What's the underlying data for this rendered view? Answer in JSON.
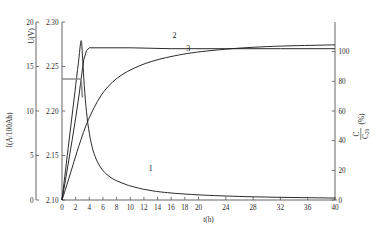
{
  "chart_data": {
    "type": "line",
    "title": "",
    "xlabel": "t(h)",
    "xlim": [
      0,
      40
    ],
    "x_ticks": [
      0,
      2,
      4,
      6,
      8,
      10,
      12,
      14,
      16,
      18,
      20,
      24,
      28,
      32,
      36,
      40
    ],
    "x_tick_labels": [
      "0",
      "2",
      "4",
      "6",
      "8",
      "10",
      "12",
      "14",
      "16",
      "18",
      "20",
      "24",
      "28",
      "32",
      "36",
      "40"
    ],
    "grid": false,
    "legend_position": "inline-curve-labels",
    "axes": [
      {
        "id": "axis-current",
        "position": "outer-left",
        "label": "I(A/100Ah)",
        "lim": [
          0,
          20
        ],
        "ticks": [
          0,
          5,
          10,
          15,
          20
        ],
        "tick_labels": [
          "0",
          "5",
          "10",
          "15",
          "20"
        ]
      },
      {
        "id": "axis-voltage",
        "position": "inner-left",
        "label": "U(V)",
        "lim": [
          2.1,
          2.3
        ],
        "ticks": [
          2.1,
          2.15,
          2.2,
          2.25,
          2.3
        ],
        "tick_labels": [
          "2.10",
          "2.15",
          "2.20",
          "2.25",
          "2.30"
        ]
      },
      {
        "id": "axis-capacity",
        "position": "right",
        "label_numerator": "C",
        "label_denominator": "C",
        "label_denominator_sub": "20",
        "label_units": "(%)",
        "label": "C/C20 (%)",
        "lim": [
          0,
          120
        ],
        "ticks": [
          0,
          20,
          40,
          60,
          80,
          100
        ],
        "tick_labels": [
          "0",
          "20",
          "40",
          "60",
          "80",
          "100"
        ]
      }
    ],
    "series": [
      {
        "name": "1",
        "curve_label": "1",
        "axis": "axis-current",
        "description": "charging current",
        "color": "#1f1f1f",
        "x": [
          0.0,
          0.4,
          0.9,
          1.4,
          1.9,
          2.4,
          2.8,
          3.0,
          3.2,
          3.5,
          3.9,
          4.4,
          5.0,
          5.8,
          6.6,
          7.5,
          8.5,
          9.5,
          10.5,
          12.0,
          13.5,
          15.0,
          17.0,
          19.0,
          21.0,
          24.0,
          28.0,
          32.0,
          36.0,
          40.0
        ],
        "y": [
          0.0,
          2.6,
          5.8,
          9.0,
          12.2,
          15.4,
          17.9,
          16.2,
          13.6,
          10.6,
          8.0,
          6.0,
          4.6,
          3.5,
          2.85,
          2.35,
          2.0,
          1.7,
          1.48,
          1.2,
          1.0,
          0.86,
          0.72,
          0.62,
          0.54,
          0.45,
          0.36,
          0.3,
          0.26,
          0.22
        ]
      },
      {
        "name": "2",
        "curve_label": "2",
        "axis": "axis-voltage",
        "description": "cell voltage",
        "color": "#1f1f1f",
        "x": [
          0.0,
          0.5,
          1.0,
          1.5,
          2.0,
          2.5,
          2.8,
          3.2,
          3.6,
          4.0,
          6.0,
          10.0,
          16.0,
          24.0,
          32.0,
          40.0
        ],
        "y": [
          2.1,
          2.122,
          2.145,
          2.168,
          2.192,
          2.218,
          2.236,
          2.258,
          2.268,
          2.271,
          2.271,
          2.271,
          2.27,
          2.27,
          2.27,
          2.27
        ]
      },
      {
        "name": "2-limit",
        "curve_label": "",
        "axis": "axis-voltage",
        "description": "constant-current limit plateau",
        "color": "#8c8c8c",
        "x": [
          0.0,
          1.0,
          2.0,
          2.8,
          3.0
        ],
        "y": [
          2.236,
          2.236,
          2.236,
          2.236,
          2.215
        ]
      },
      {
        "name": "3",
        "curve_label": "3",
        "axis": "axis-capacity",
        "description": "charge returned capacity",
        "color": "#1f1f1f",
        "x": [
          0.0,
          0.5,
          1.0,
          1.6,
          2.2,
          2.8,
          3.5,
          4.3,
          5.2,
          6.2,
          7.4,
          8.8,
          10.4,
          12.2,
          14.2,
          16.5,
          19.0,
          22.0,
          26.0,
          30.0,
          34.0,
          40.0
        ],
        "y": [
          0.0,
          7.0,
          14.5,
          23.5,
          32.5,
          41.0,
          50.0,
          58.5,
          66.5,
          73.5,
          79.5,
          84.5,
          88.5,
          92.0,
          94.8,
          97.2,
          99.2,
          100.8,
          102.4,
          103.4,
          104.0,
          104.6
        ]
      }
    ],
    "annotations": [
      {
        "name": "curve-label-1",
        "text": "1",
        "x": 13.0,
        "axis_value": 3.3,
        "axis": "axis-current"
      },
      {
        "name": "curve-label-2",
        "text": "2",
        "x": 16.5,
        "axis_value": 2.282,
        "axis": "axis-voltage"
      },
      {
        "name": "curve-label-3",
        "text": "3",
        "x": 18.5,
        "axis_value": 100.5,
        "axis": "axis-capacity"
      }
    ]
  }
}
